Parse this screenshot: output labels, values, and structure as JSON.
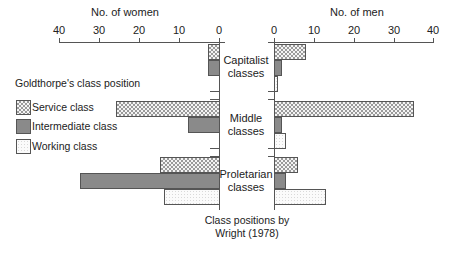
{
  "chart_data": {
    "type": "bar",
    "orientation": "horizontal",
    "layout": "back-to-back (population pyramid style)",
    "title": "",
    "categories": [
      "Capitalist classes",
      "Middle classes",
      "Proletarian classes"
    ],
    "category_axis_label": "Class positions by Wright (1978)",
    "legend_title": "Goldthorpe's class position",
    "legend": [
      "Service class",
      "Intermediate class",
      "Working class"
    ],
    "panels": [
      {
        "name": "women",
        "xlabel": "No. of women",
        "xlim": [
          40,
          0
        ],
        "ticks": [
          40,
          30,
          20,
          10,
          0
        ],
        "series": [
          {
            "name": "Service class",
            "values": [
              3,
              26,
              15
            ]
          },
          {
            "name": "Intermediate class",
            "values": [
              3,
              8,
              35
            ]
          },
          {
            "name": "Working class",
            "values": [
              0,
              0,
              14
            ]
          }
        ]
      },
      {
        "name": "men",
        "xlabel": "No. of men",
        "xlim": [
          0,
          40
        ],
        "ticks": [
          0,
          10,
          20,
          30,
          40
        ],
        "series": [
          {
            "name": "Service class",
            "values": [
              8,
              35,
              6
            ]
          },
          {
            "name": "Intermediate class",
            "values": [
              2,
              2,
              3
            ]
          },
          {
            "name": "Working class",
            "values": [
              1,
              3,
              13
            ]
          }
        ]
      }
    ]
  },
  "labels": {
    "women_axis": "No. of women",
    "men_axis": "No. of men",
    "women_ticks": [
      "40",
      "30",
      "20",
      "10",
      "0"
    ],
    "men_ticks": [
      "0",
      "10",
      "20",
      "30",
      "40"
    ],
    "categories": [
      {
        "line1": "Capitalist",
        "line2": "classes"
      },
      {
        "line1": "Middle",
        "line2": "classes"
      },
      {
        "line1": "Proletarian",
        "line2": "classes"
      }
    ],
    "legend_title": "Goldthorpe's class position",
    "legend_items": [
      "Service class",
      "Intermediate class",
      "Working class"
    ],
    "footer_line1": "Class positions by",
    "footer_line2": "Wright (1978)"
  }
}
